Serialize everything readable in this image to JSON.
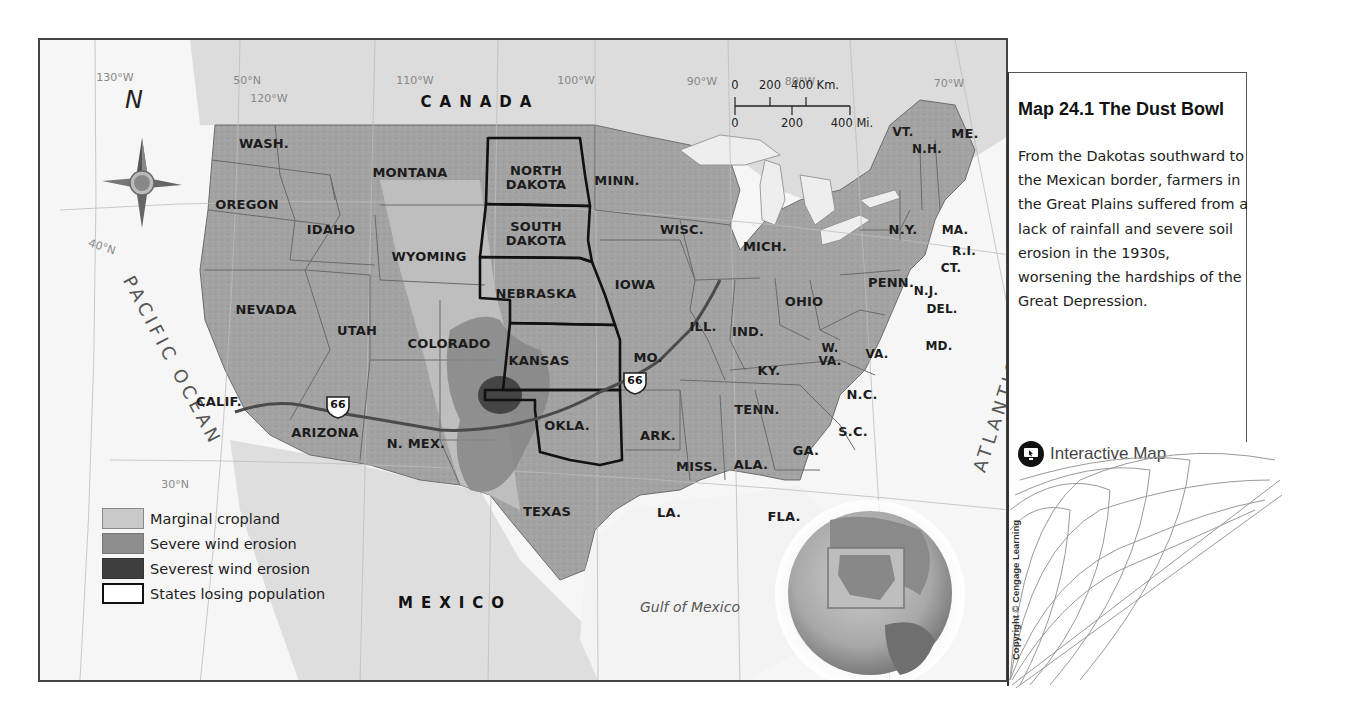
{
  "map": {
    "countries": [
      {
        "name": "CANADA",
        "x": 440,
        "y": 62
      },
      {
        "name": "MEXICO",
        "x": 415,
        "y": 563
      }
    ],
    "oceans": {
      "pacific": "PACIFIC OCEAN",
      "atlantic": "ATLANTIC OCEAN",
      "gulf": "Gulf of Mexico"
    },
    "compass": {
      "north_label": "N"
    },
    "gridlines": [
      {
        "label": "130°W",
        "x": 75,
        "y": 37
      },
      {
        "label": "50°N",
        "x": 207,
        "y": 40
      },
      {
        "label": "120°W",
        "x": 229,
        "y": 58
      },
      {
        "label": "110°W",
        "x": 375,
        "y": 40
      },
      {
        "label": "100°W",
        "x": 536,
        "y": 40
      },
      {
        "label": "90°W",
        "x": 662,
        "y": 41
      },
      {
        "label": "80°W",
        "x": 760,
        "y": 41
      },
      {
        "label": "70°W",
        "x": 909,
        "y": 43
      },
      {
        "label": "40°N",
        "x": 62,
        "y": 207
      },
      {
        "label": "30°N",
        "x": 135,
        "y": 444
      }
    ],
    "scale_bar": {
      "km_ticks": [
        "0",
        "200",
        "400 Km."
      ],
      "mi_ticks": [
        "0",
        "200",
        "400 Mi."
      ]
    },
    "states": [
      {
        "label": "WASH.",
        "x": 224,
        "y": 104
      },
      {
        "label": "OREGON",
        "x": 207,
        "y": 165
      },
      {
        "label": "IDAHO",
        "x": 291,
        "y": 190
      },
      {
        "label": "MONTANA",
        "x": 370,
        "y": 133
      },
      {
        "label": "WYOMING",
        "x": 389,
        "y": 217
      },
      {
        "label": "NORTH\nDAKOTA",
        "x": 496,
        "y": 138,
        "bold_border": true
      },
      {
        "label": "SOUTH\nDAKOTA",
        "x": 496,
        "y": 194,
        "bold_border": true
      },
      {
        "label": "NEBRASKA",
        "x": 496,
        "y": 254,
        "bold_border": true
      },
      {
        "label": "KANSAS",
        "x": 499,
        "y": 321,
        "bold_border": true
      },
      {
        "label": "OKLA.",
        "x": 527,
        "y": 386,
        "bold_border": true
      },
      {
        "label": "MINN.",
        "x": 577,
        "y": 141
      },
      {
        "label": "WISC.",
        "x": 642,
        "y": 190
      },
      {
        "label": "IOWA",
        "x": 595,
        "y": 245
      },
      {
        "label": "MICH.",
        "x": 725,
        "y": 207
      },
      {
        "label": "ILL.",
        "x": 663,
        "y": 287
      },
      {
        "label": "IND.",
        "x": 708,
        "y": 292
      },
      {
        "label": "OHIO",
        "x": 764,
        "y": 262
      },
      {
        "label": "MO.",
        "x": 608,
        "y": 318
      },
      {
        "label": "KY.",
        "x": 729,
        "y": 331
      },
      {
        "label": "W.\nVA.",
        "x": 790,
        "y": 315
      },
      {
        "label": "VA.",
        "x": 837,
        "y": 314
      },
      {
        "label": "PENN.",
        "x": 851,
        "y": 243
      },
      {
        "label": "N.Y.",
        "x": 863,
        "y": 190
      },
      {
        "label": "VT.",
        "x": 863,
        "y": 92
      },
      {
        "label": "N.H.",
        "x": 887,
        "y": 109
      },
      {
        "label": "ME.",
        "x": 925,
        "y": 94
      },
      {
        "label": "MA.",
        "x": 915,
        "y": 190
      },
      {
        "label": "R.I.",
        "x": 924,
        "y": 211
      },
      {
        "label": "CT.",
        "x": 911,
        "y": 228
      },
      {
        "label": "N.J.",
        "x": 886,
        "y": 251
      },
      {
        "label": "DEL.",
        "x": 902,
        "y": 269
      },
      {
        "label": "MD.",
        "x": 899,
        "y": 306
      },
      {
        "label": "N.C.",
        "x": 822,
        "y": 355
      },
      {
        "label": "S.C.",
        "x": 813,
        "y": 392
      },
      {
        "label": "GA.",
        "x": 766,
        "y": 411
      },
      {
        "label": "TENN.",
        "x": 717,
        "y": 370
      },
      {
        "label": "ARK.",
        "x": 618,
        "y": 396
      },
      {
        "label": "MISS.",
        "x": 657,
        "y": 427
      },
      {
        "label": "ALA.",
        "x": 711,
        "y": 425
      },
      {
        "label": "LA.",
        "x": 629,
        "y": 473
      },
      {
        "label": "FLA.",
        "x": 744,
        "y": 477
      },
      {
        "label": "TEXAS",
        "x": 507,
        "y": 472
      },
      {
        "label": "N. MEX.",
        "x": 376,
        "y": 404
      },
      {
        "label": "ARIZONA",
        "x": 285,
        "y": 393
      },
      {
        "label": "COLORADO",
        "x": 409,
        "y": 304
      },
      {
        "label": "UTAH",
        "x": 317,
        "y": 291
      },
      {
        "label": "NEVADA",
        "x": 226,
        "y": 270
      },
      {
        "label": "CALIF.",
        "x": 179,
        "y": 362
      }
    ],
    "route_shields": [
      {
        "label": "66",
        "x": 298,
        "y": 367
      },
      {
        "label": "66",
        "x": 595,
        "y": 343
      }
    ]
  },
  "legend": {
    "items": [
      {
        "label": "Marginal cropland",
        "color": "#c9c9c9",
        "border": "#888888"
      },
      {
        "label": "Severe wind erosion",
        "color": "#8d8d8d",
        "border": "#777777"
      },
      {
        "label": "Severest wind erosion",
        "color": "#3e3e3e",
        "border": "#333333"
      },
      {
        "label": "States losing population",
        "color": "#ffffff",
        "border": "#111111"
      }
    ]
  },
  "caption": {
    "title": "Map 24.1   The Dust Bowl",
    "body": "From the Dakotas southward to the Mexican border, farmers in the Great Plains suffered from a lack of rainfall and severe soil erosion in the 1930s, worsening the hardships of the Great Depression.",
    "link_label": "Interactive Map",
    "copyright": "Copyright © Cengage Learning"
  },
  "colors": {
    "land": "#9a9a9a",
    "land_light": "#b9b9b9",
    "water": "#f2f2f2",
    "border_bold": "#111111",
    "state_line": "#6a6a6a"
  }
}
